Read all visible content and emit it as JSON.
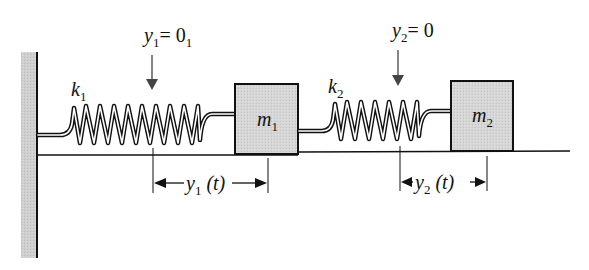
{
  "diagram": {
    "colors": {
      "wall_fill": "#c9c9c9",
      "mass_fill": "#d6d6d6",
      "stroke": "#111111",
      "arrow": "#444444"
    },
    "wall": {
      "label": "fixed-wall"
    },
    "springs": [
      {
        "id": "k1",
        "symbol": "k",
        "subscript": "1",
        "coils": 9
      },
      {
        "id": "k2",
        "symbol": "k",
        "subscript": "2",
        "coils": 6
      }
    ],
    "masses": [
      {
        "id": "m1",
        "symbol": "m",
        "subscript": "1"
      },
      {
        "id": "m2",
        "symbol": "m",
        "subscript": "2"
      }
    ],
    "equilibrium_markers": [
      {
        "symbol": "y",
        "subscript": "1",
        "equals": "= 0",
        "trailing_subscript": "1"
      },
      {
        "symbol": "y",
        "subscript": "2",
        "equals": "= 0",
        "trailing_subscript": ""
      }
    ],
    "displacements": [
      {
        "symbol": "y",
        "subscript": "1",
        "arg": "(t)"
      },
      {
        "symbol": "y",
        "subscript": "2",
        "arg": "(t)"
      }
    ]
  }
}
